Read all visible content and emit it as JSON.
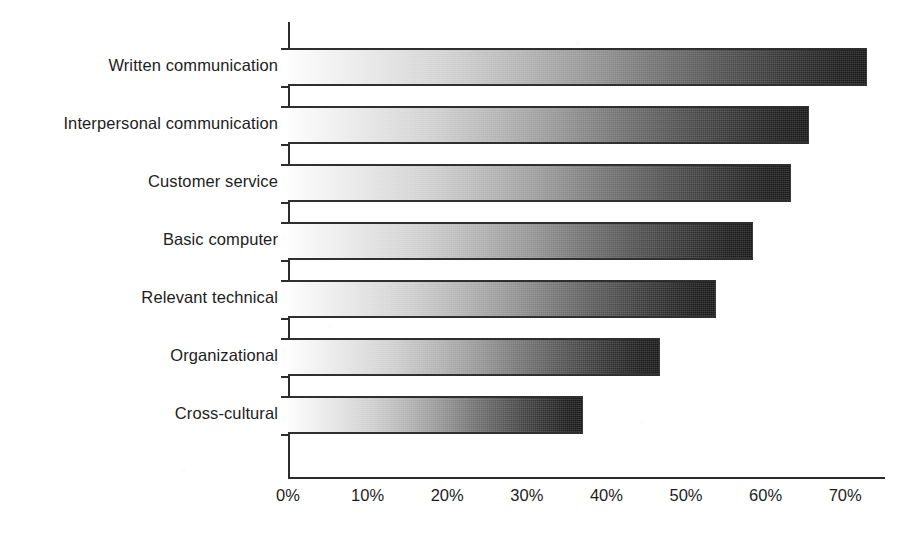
{
  "chart_data": {
    "type": "bar",
    "orientation": "horizontal",
    "title": "",
    "subtitle": "",
    "xlabel": "",
    "ylabel": "",
    "grid": false,
    "legend": false,
    "legend_position": "none",
    "xlim": [
      0,
      78
    ],
    "xticks": [
      0,
      10,
      20,
      30,
      40,
      50,
      60,
      70
    ],
    "xtick_labels": [
      "0%",
      "10%",
      "20%",
      "30%",
      "40%",
      "50%",
      "60%",
      "70%"
    ],
    "categories": [
      "Written communication",
      "Interpersonal communication",
      "Customer service",
      "Basic computer",
      "Relevant technical",
      "Organizational",
      "Cross-cultural"
    ],
    "values": [
      72.7,
      65.5,
      63.2,
      58.4,
      53.8,
      46.7,
      37.1
    ],
    "value_unit": "%",
    "bar_style": {
      "fill": "horizontal-gradient",
      "gradient_from": "#fdfdfd",
      "gradient_to": "#151515",
      "border_color": "#2f2f2f"
    }
  },
  "axes": {
    "x_axis_color": "#2b2b2b",
    "y_axis_color": "#2b2b2b"
  },
  "canvas": {
    "background": "#ffffff",
    "text_color": "#1d1d1d"
  }
}
